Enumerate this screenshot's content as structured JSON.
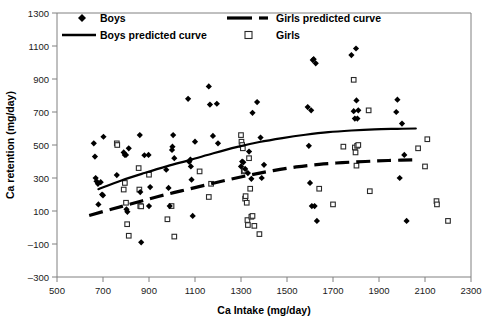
{
  "chart_data": {
    "type": "scatter",
    "title": "",
    "xlabel": "Ca Intake (mg/day)",
    "ylabel": "Ca retention (mg/day)",
    "xlim": [
      500,
      2300
    ],
    "ylim": [
      -300,
      1300
    ],
    "xticks": [
      500,
      700,
      900,
      1100,
      1300,
      1500,
      1700,
      1900,
      2100,
      2300
    ],
    "yticks": [
      -300,
      -100,
      100,
      300,
      500,
      700,
      900,
      1100,
      1300
    ],
    "grid": false,
    "legend_position": "top-inside",
    "legend": [
      {
        "label": "Boys",
        "marker": "filled-diamond",
        "color": "#000000"
      },
      {
        "label": "Girls predicted curve",
        "marker": "dashed-line",
        "color": "#000000"
      },
      {
        "label": "Boys predicted curve",
        "marker": "solid-line",
        "color": "#000000"
      },
      {
        "label": "Girls",
        "marker": "open-square",
        "color": "#000000"
      }
    ],
    "series": [
      {
        "name": "Boys",
        "marker": "filled-diamond",
        "points": [
          [
            660,
            510
          ],
          [
            665,
            430
          ],
          [
            668,
            300
          ],
          [
            672,
            280
          ],
          [
            678,
            265
          ],
          [
            680,
            140
          ],
          [
            690,
            275
          ],
          [
            696,
            200
          ],
          [
            700,
            195
          ],
          [
            702,
            550
          ],
          [
            760,
            318
          ],
          [
            790,
            455
          ],
          [
            795,
            440
          ],
          [
            800,
            440
          ],
          [
            802,
            110
          ],
          [
            806,
            95
          ],
          [
            812,
            480
          ],
          [
            860,
            560
          ],
          [
            862,
            215
          ],
          [
            866,
            -90
          ],
          [
            880,
            438
          ],
          [
            898,
            440
          ],
          [
            900,
            130
          ],
          [
            905,
            245
          ],
          [
            975,
            350
          ],
          [
            985,
            240
          ],
          [
            990,
            130
          ],
          [
            1000,
            470
          ],
          [
            1002,
            490
          ],
          [
            1005,
            560
          ],
          [
            1010,
            420
          ],
          [
            1070,
            780
          ],
          [
            1075,
            398
          ],
          [
            1080,
            412
          ],
          [
            1082,
            370
          ],
          [
            1085,
            290
          ],
          [
            1090,
            70
          ],
          [
            1100,
            520
          ],
          [
            1160,
            855
          ],
          [
            1165,
            745
          ],
          [
            1195,
            750
          ],
          [
            1178,
            555
          ],
          [
            1200,
            510
          ],
          [
            1300,
            370
          ],
          [
            1305,
            400
          ],
          [
            1310,
            395
          ],
          [
            1318,
            355
          ],
          [
            1330,
            330
          ],
          [
            1335,
            460
          ],
          [
            1345,
            295
          ],
          [
            1350,
            695
          ],
          [
            1370,
            760
          ],
          [
            1385,
            545
          ],
          [
            1390,
            300
          ],
          [
            1400,
            380
          ],
          [
            1590,
            730
          ],
          [
            1595,
            495
          ],
          [
            1600,
            270
          ],
          [
            1605,
            710
          ],
          [
            1608,
            130
          ],
          [
            1612,
            1015
          ],
          [
            1616,
            1020
          ],
          [
            1620,
            130
          ],
          [
            1625,
            995
          ],
          [
            1630,
            40
          ],
          [
            1780,
            1045
          ],
          [
            1790,
            705
          ],
          [
            1795,
            660
          ],
          [
            1800,
            1085
          ],
          [
            1802,
            770
          ],
          [
            1806,
            660
          ],
          [
            1810,
            710
          ],
          [
            1975,
            700
          ],
          [
            1980,
            775
          ],
          [
            1990,
            300
          ],
          [
            2000,
            630
          ],
          [
            2010,
            440
          ],
          [
            2020,
            40
          ]
        ]
      },
      {
        "name": "Girls",
        "marker": "open-square",
        "points": [
          [
            760,
            510
          ],
          [
            762,
            500
          ],
          [
            790,
            230
          ],
          [
            795,
            270
          ],
          [
            800,
            150
          ],
          [
            805,
            20
          ],
          [
            812,
            -50
          ],
          [
            855,
            360
          ],
          [
            858,
            230
          ],
          [
            862,
            130
          ],
          [
            866,
            128
          ],
          [
            900,
            320
          ],
          [
            980,
            50
          ],
          [
            998,
            130
          ],
          [
            1010,
            -55
          ],
          [
            1120,
            340
          ],
          [
            1160,
            185
          ],
          [
            1170,
            265
          ],
          [
            1300,
            560
          ],
          [
            1302,
            520
          ],
          [
            1305,
            500
          ],
          [
            1308,
            480
          ],
          [
            1312,
            340
          ],
          [
            1315,
            345
          ],
          [
            1318,
            175
          ],
          [
            1320,
            190
          ],
          [
            1325,
            150
          ],
          [
            1328,
            45
          ],
          [
            1330,
            15
          ],
          [
            1335,
            420
          ],
          [
            1340,
            235
          ],
          [
            1345,
            65
          ],
          [
            1350,
            70
          ],
          [
            1358,
            10
          ],
          [
            1380,
            -40
          ],
          [
            1640,
            235
          ],
          [
            1700,
            140
          ],
          [
            1745,
            490
          ],
          [
            1790,
            895
          ],
          [
            1795,
            485
          ],
          [
            1798,
            455
          ],
          [
            1802,
            375
          ],
          [
            1805,
            495
          ],
          [
            1810,
            500
          ],
          [
            1855,
            710
          ],
          [
            1860,
            220
          ],
          [
            2070,
            480
          ],
          [
            2100,
            370
          ],
          [
            2110,
            535
          ],
          [
            2150,
            160
          ],
          [
            2152,
            140
          ],
          [
            2200,
            40
          ]
        ]
      }
    ],
    "curves": [
      {
        "name": "Boys predicted curve",
        "style": "solid",
        "points": [
          [
            680,
            232
          ],
          [
            780,
            285
          ],
          [
            880,
            330
          ],
          [
            980,
            372
          ],
          [
            1080,
            410
          ],
          [
            1180,
            450
          ],
          [
            1280,
            487
          ],
          [
            1380,
            518
          ],
          [
            1480,
            542
          ],
          [
            1580,
            562
          ],
          [
            1680,
            578
          ],
          [
            1780,
            588
          ],
          [
            1880,
            595
          ],
          [
            1980,
            598
          ],
          [
            2060,
            600
          ]
        ]
      },
      {
        "name": "Girls predicted curve",
        "style": "dashed",
        "points": [
          [
            640,
            73
          ],
          [
            740,
            112
          ],
          [
            840,
            150
          ],
          [
            940,
            188
          ],
          [
            1040,
            222
          ],
          [
            1140,
            255
          ],
          [
            1240,
            288
          ],
          [
            1340,
            318
          ],
          [
            1440,
            345
          ],
          [
            1540,
            367
          ],
          [
            1640,
            383
          ],
          [
            1740,
            393
          ],
          [
            1840,
            400
          ],
          [
            1940,
            406
          ],
          [
            2070,
            410
          ]
        ]
      }
    ]
  },
  "axes": {
    "x_title": "Ca Intake (mg/day)",
    "y_title": "Ca retention (mg/day)"
  }
}
